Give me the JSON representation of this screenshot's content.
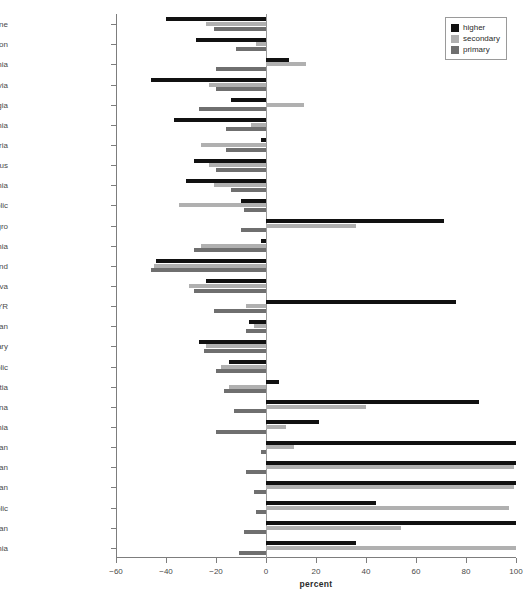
{
  "figure": {
    "title": ""
  },
  "legend": {
    "position": "top-right",
    "items": [
      {
        "label": "higher",
        "color": "#111111"
      },
      {
        "label": "secondary",
        "color": "#b0b0b0"
      },
      {
        "label": "primary",
        "color": "#6f6f6f"
      }
    ]
  },
  "axes": {
    "xlabel": "percent",
    "ylabel": "",
    "xticks": [
      -60,
      -40,
      -20,
      0,
      20,
      40,
      60,
      80,
      100
    ],
    "xticklabels": [
      "−60",
      "−40",
      "−20",
      "0",
      "20",
      "40",
      "60",
      "80",
      "100"
    ],
    "xlim": [
      -60,
      100
    ],
    "grid": false
  },
  "chart_data": {
    "type": "bar",
    "orientation": "horizontal",
    "title": "",
    "xlabel": "percent",
    "ylabel": "",
    "xlim": [
      -60,
      100
    ],
    "grid": false,
    "legend_position": "top-right",
    "categories": [
      "Ukraine",
      "Russian Federation",
      "Lithuania",
      "Latvia",
      "Georgia",
      "Estonia",
      "Bulgaria",
      "Belarus",
      "Slovenia",
      "Slovak Republic",
      "Serbia and Montenegro",
      "Romania",
      "Poland",
      "Moldova",
      "Macedonia, FYR",
      "Kazakhstan",
      "Hungary",
      "Czech Republic",
      "Croatia",
      "Bosnia and Herzegovina",
      "Armenia",
      "Uzbekistan",
      "Turkmenistan",
      "Tajikistan",
      "Kyrgyz Republic",
      "Azerbaijan",
      "Albania"
    ],
    "series": [
      {
        "name": "higher",
        "color": "#111111",
        "values": [
          -40,
          -28,
          9,
          -46,
          -14,
          -37,
          -2,
          -29,
          -32,
          -10,
          71,
          -2,
          -44,
          -24,
          76,
          -7,
          -27,
          -15,
          5,
          85,
          21,
          100,
          100,
          100,
          44,
          100,
          36
        ]
      },
      {
        "name": "secondary",
        "color": "#b0b0b0",
        "values": [
          -24,
          -4,
          16,
          -23,
          15,
          -6,
          -26,
          -23,
          -21,
          -35,
          36,
          -26,
          -45,
          -31,
          -8,
          -5,
          -24,
          -18,
          -15,
          40,
          8,
          11,
          99,
          99,
          97,
          54,
          100
        ]
      },
      {
        "name": "primary",
        "color": "#6f6f6f",
        "values": [
          -21,
          -12,
          -20,
          -20,
          -27,
          -16,
          -16,
          -20,
          -14,
          -9,
          -10,
          -29,
          -46,
          -29,
          -21,
          -8,
          -25,
          -20,
          -17,
          -13,
          -20,
          -2,
          -8,
          -5,
          -4,
          -9,
          -11
        ]
      }
    ]
  }
}
